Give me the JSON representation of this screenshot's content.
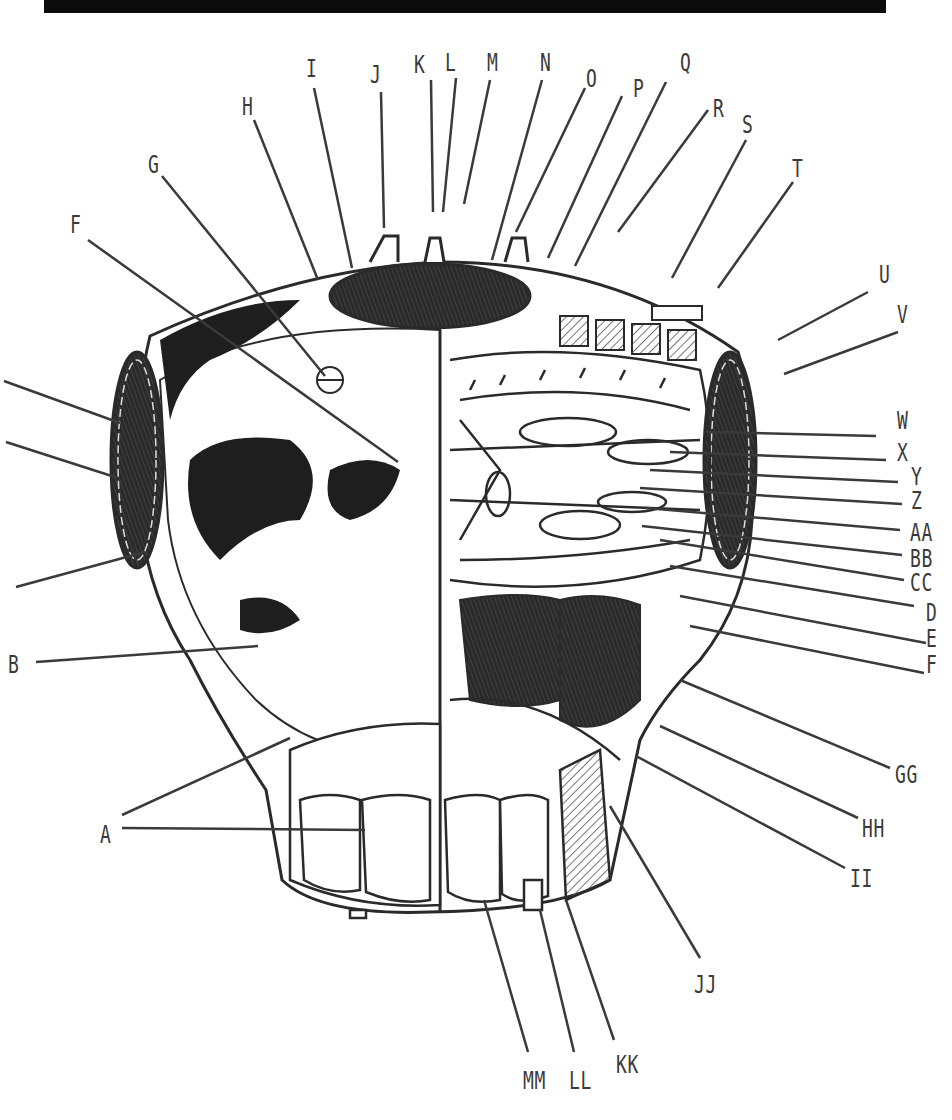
{
  "figure": {
    "colors": {
      "background": "#ffffff",
      "ink": "#2a2a2a",
      "dark_fill": "#1e1e1e",
      "mid_fill": "#555555",
      "hatch": "#8a8a8a",
      "top_bar": "#0c0c0c"
    }
  },
  "callouts": [
    {
      "id": "A",
      "label": "A",
      "x": 100,
      "y": 822,
      "line": [
        [
          122,
          815
        ],
        [
          290,
          738
        ]
      ],
      "line2": [
        [
          122,
          828
        ],
        [
          365,
          830
        ]
      ]
    },
    {
      "id": "B",
      "label": "B",
      "x": 8,
      "y": 652,
      "line": [
        [
          36,
          662
        ],
        [
          258,
          646
        ]
      ]
    },
    {
      "id": "C",
      "label": "",
      "x": 0,
      "y": 580,
      "line": [
        [
          16,
          587
        ],
        [
          145,
          552
        ]
      ]
    },
    {
      "id": "D",
      "label": "",
      "x": 0,
      "y": 436,
      "line": [
        [
          6,
          442
        ],
        [
          118,
          478
        ]
      ]
    },
    {
      "id": "E",
      "label": "",
      "x": 0,
      "y": 377,
      "line": [
        [
          4,
          381
        ],
        [
          120,
          423
        ]
      ]
    },
    {
      "id": "F",
      "label": "F",
      "x": 70,
      "y": 212,
      "line": [
        [
          88,
          240
        ],
        [
          398,
          462
        ]
      ]
    },
    {
      "id": "G",
      "label": "G",
      "x": 148,
      "y": 152,
      "line": [
        [
          162,
          176
        ],
        [
          325,
          376
        ]
      ]
    },
    {
      "id": "H",
      "label": "H",
      "x": 242,
      "y": 94,
      "line": [
        [
          254,
          120
        ],
        [
          318,
          280
        ]
      ]
    },
    {
      "id": "I",
      "label": "I",
      "x": 306,
      "y": 56,
      "line": [
        [
          314,
          88
        ],
        [
          352,
          268
        ]
      ]
    },
    {
      "id": "J",
      "label": "J",
      "x": 370,
      "y": 62,
      "line": [
        [
          381,
          92
        ],
        [
          384,
          228
        ]
      ]
    },
    {
      "id": "K",
      "label": "K",
      "x": 414,
      "y": 52,
      "line": [
        [
          431,
          80
        ],
        [
          433,
          212
        ]
      ]
    },
    {
      "id": "L",
      "label": "L",
      "x": 445,
      "y": 50,
      "line": [
        [
          456,
          78
        ],
        [
          443,
          212
        ]
      ]
    },
    {
      "id": "M",
      "label": "M",
      "x": 487,
      "y": 50,
      "line": [
        [
          490,
          80
        ],
        [
          464,
          204
        ]
      ]
    },
    {
      "id": "N",
      "label": "N",
      "x": 540,
      "y": 50,
      "line": [
        [
          542,
          80
        ],
        [
          492,
          260
        ]
      ]
    },
    {
      "id": "O",
      "label": "O",
      "x": 586,
      "y": 66,
      "line": [
        [
          585,
          88
        ],
        [
          516,
          232
        ]
      ]
    },
    {
      "id": "P",
      "label": "P",
      "x": 633,
      "y": 76,
      "line": [
        [
          622,
          96
        ],
        [
          548,
          258
        ]
      ]
    },
    {
      "id": "Q",
      "label": "Q",
      "x": 680,
      "y": 50,
      "line": [
        [
          666,
          82
        ],
        [
          575,
          266
        ]
      ]
    },
    {
      "id": "R",
      "label": "R",
      "x": 713,
      "y": 96,
      "line": [
        [
          708,
          110
        ],
        [
          618,
          232
        ]
      ]
    },
    {
      "id": "S",
      "label": "S",
      "x": 742,
      "y": 112,
      "line": [
        [
          746,
          140
        ],
        [
          672,
          278
        ]
      ]
    },
    {
      "id": "T",
      "label": "T",
      "x": 792,
      "y": 156,
      "line": [
        [
          793,
          182
        ],
        [
          718,
          288
        ]
      ]
    },
    {
      "id": "U",
      "label": "U",
      "x": 879,
      "y": 262,
      "line": [
        [
          868,
          292
        ],
        [
          778,
          340
        ]
      ]
    },
    {
      "id": "V",
      "label": "V",
      "x": 897,
      "y": 302,
      "line": [
        [
          898,
          332
        ],
        [
          784,
          374
        ]
      ]
    },
    {
      "id": "W",
      "label": "W",
      "x": 897,
      "y": 408,
      "line": [
        [
          876,
          436
        ],
        [
          706,
          432
        ]
      ]
    },
    {
      "id": "X",
      "label": "X",
      "x": 897,
      "y": 440,
      "line": [
        [
          886,
          460
        ],
        [
          670,
          452
        ]
      ]
    },
    {
      "id": "Y",
      "label": "Y",
      "x": 911,
      "y": 464,
      "line": [
        [
          898,
          482
        ],
        [
          650,
          470
        ]
      ]
    },
    {
      "id": "Z",
      "label": "Z",
      "x": 911,
      "y": 488,
      "line": [
        [
          902,
          504
        ],
        [
          640,
          488
        ]
      ]
    },
    {
      "id": "AA",
      "label": "AA",
      "x": 910,
      "y": 520,
      "line": [
        [
          900,
          530
        ],
        [
          646,
          508
        ]
      ]
    },
    {
      "id": "BB",
      "label": "BB",
      "x": 910,
      "y": 546,
      "line": [
        [
          902,
          555
        ],
        [
          642,
          526
        ]
      ]
    },
    {
      "id": "CC",
      "label": "CC",
      "x": 910,
      "y": 570,
      "line": [
        [
          904,
          580
        ],
        [
          660,
          540
        ]
      ]
    },
    {
      "id": "DD",
      "label": "D",
      "x": 926,
      "y": 600,
      "line": [
        [
          914,
          606
        ],
        [
          670,
          566
        ]
      ]
    },
    {
      "id": "EE",
      "label": "E",
      "x": 926,
      "y": 626,
      "line": [
        [
          926,
          643
        ],
        [
          680,
          596
        ]
      ]
    },
    {
      "id": "FF",
      "label": "F",
      "x": 926,
      "y": 652,
      "line": [
        [
          924,
          673
        ],
        [
          690,
          626
        ]
      ]
    },
    {
      "id": "GG",
      "label": "GG",
      "x": 895,
      "y": 762,
      "line": [
        [
          890,
          768
        ],
        [
          680,
          680
        ]
      ]
    },
    {
      "id": "HH",
      "label": "HH",
      "x": 862,
      "y": 816,
      "line": [
        [
          858,
          818
        ],
        [
          660,
          726
        ]
      ]
    },
    {
      "id": "II",
      "label": "II",
      "x": 850,
      "y": 866,
      "line": [
        [
          845,
          868
        ],
        [
          636,
          756
        ]
      ]
    },
    {
      "id": "JJ",
      "label": "JJ",
      "x": 694,
      "y": 972,
      "line": [
        [
          700,
          958
        ],
        [
          610,
          806
        ]
      ]
    },
    {
      "id": "KK",
      "label": "KK",
      "x": 616,
      "y": 1052,
      "line": [
        [
          614,
          1040
        ],
        [
          566,
          900
        ]
      ]
    },
    {
      "id": "LL",
      "label": "LL",
      "x": 569,
      "y": 1068,
      "line": [
        [
          574,
          1052
        ],
        [
          540,
          910
        ]
      ]
    },
    {
      "id": "MM",
      "label": "MM",
      "x": 523,
      "y": 1068,
      "line": [
        [
          528,
          1052
        ],
        [
          484,
          900
        ]
      ]
    }
  ]
}
